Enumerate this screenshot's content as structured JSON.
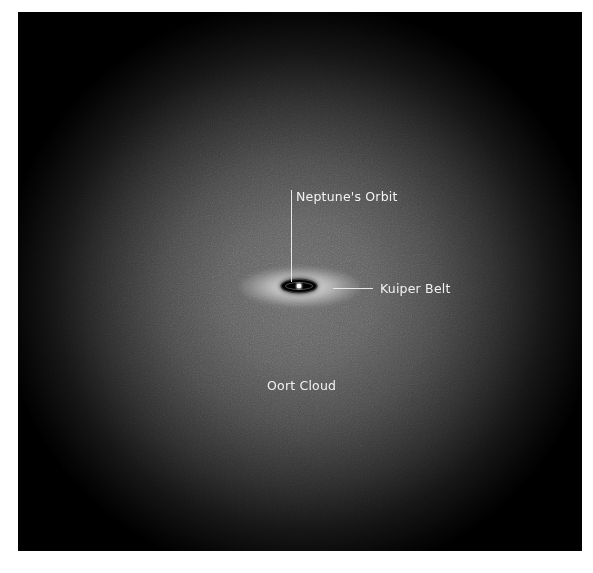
{
  "diagram": {
    "title": "",
    "labels": {
      "neptune_orbit": "Neptune's Orbit",
      "kuiper_belt": "Kuiper Belt",
      "oort_cloud": "Oort Cloud"
    },
    "colors": {
      "background": "#000000",
      "cloud_center": "#6a6a6a",
      "label_text": "#f2f2f2",
      "leader_line": "#e8e8e8",
      "page": "#ffffff"
    }
  }
}
